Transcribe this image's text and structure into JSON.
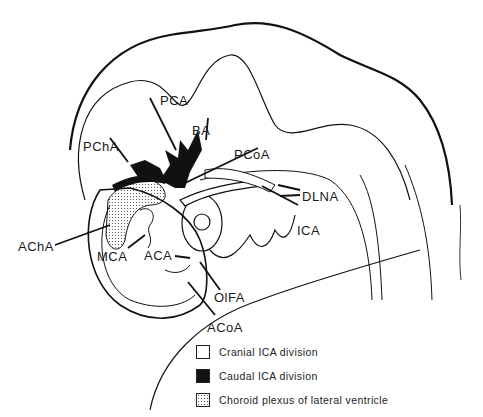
{
  "figure": {
    "type": "anatomical illustration"
  },
  "labels": {
    "pca": "PCA",
    "ba": "BA",
    "pcha": "PChA",
    "pcoa": "PCoA",
    "dlna": "DLNA",
    "ica": "ICA",
    "acha": "AChA",
    "mca": "MCA",
    "aca": "ACA",
    "olfa": "OlFA",
    "acoa": "ACoA"
  },
  "legend": {
    "items": [
      {
        "swatch": "white",
        "label": "Cranial ICA division"
      },
      {
        "swatch": "black",
        "label": "Caudal ICA division"
      },
      {
        "swatch": "dotted",
        "label": "Choroid plexus of lateral ventricle"
      }
    ]
  },
  "colors": {
    "ink": "#111111",
    "background": "#ffffff"
  }
}
